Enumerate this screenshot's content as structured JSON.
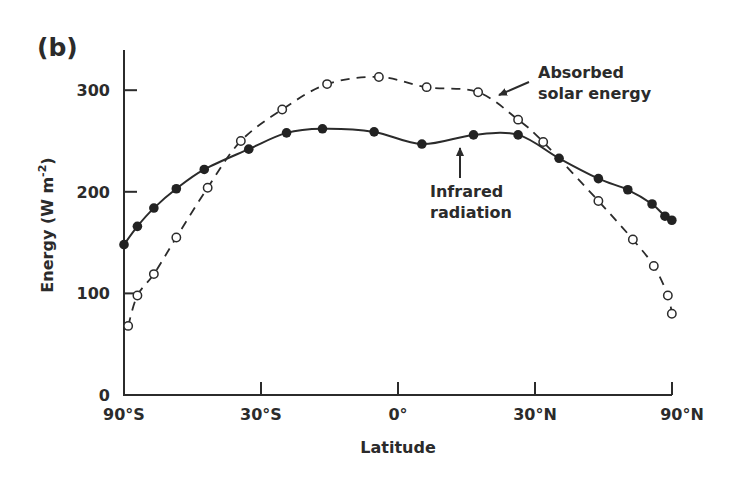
{
  "panel_label": "(b)",
  "chart_data": {
    "type": "line",
    "title": "",
    "xlabel": "Latitude",
    "ylabel": "Energy (W m-2)",
    "ylabel_base": "Energy (W m",
    "ylabel_sup": "-2",
    "ylabel_close": ")",
    "x_scale": "sine of latitude (area-weighted)",
    "xlim": [
      -90,
      90
    ],
    "ylim": [
      0,
      340
    ],
    "x_ticks": [
      {
        "value": -90,
        "label": "90°S"
      },
      {
        "value": -30,
        "label": "30°S"
      },
      {
        "value": 0,
        "label": "0°"
      },
      {
        "value": 30,
        "label": "30°N"
      },
      {
        "value": 90,
        "label": "90°N"
      }
    ],
    "y_ticks": [
      {
        "value": 0,
        "label": "0"
      },
      {
        "value": 100,
        "label": "100"
      },
      {
        "value": 200,
        "label": "200"
      },
      {
        "value": 300,
        "label": "300"
      }
    ],
    "grid": false,
    "legend": "none (inline annotations)",
    "series": [
      {
        "name": "Absorbed solar energy",
        "style": "dashed, open circles",
        "x": [
          -80,
          -72,
          -63,
          -54,
          -44,
          -35,
          -25,
          -15,
          -4,
          6,
          17,
          26,
          32,
          47,
          59,
          69,
          80,
          88
        ],
        "values": [
          68,
          98,
          119,
          155,
          204,
          250,
          281,
          306,
          313,
          303,
          298,
          271,
          249,
          191,
          153,
          127,
          98,
          80
        ]
      },
      {
        "name": "Infrared radiation",
        "style": "solid, filled circles",
        "x": [
          -90,
          -72,
          -63,
          -54,
          -45,
          -33,
          -24,
          -16,
          -5,
          5,
          16,
          26,
          36,
          47,
          57,
          68,
          77,
          88
        ],
        "values": [
          148,
          166,
          184,
          203,
          222,
          242,
          258,
          262,
          259,
          247,
          256,
          256,
          233,
          213,
          202,
          188,
          176,
          172
        ]
      }
    ],
    "annotations": [
      {
        "text_lines": [
          "Absorbed",
          "solar energy"
        ],
        "target_series": "Absorbed solar energy"
      },
      {
        "text_lines": [
          "Infrared",
          "radiation"
        ],
        "target_series": "Infrared radiation"
      }
    ]
  }
}
